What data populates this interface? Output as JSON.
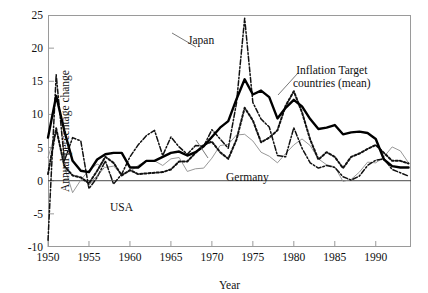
{
  "chart_data": {
    "type": "line",
    "title": "",
    "xlabel": "Year",
    "ylabel": "Annual percentage change",
    "xlim": [
      1950,
      1994.3
    ],
    "ylim": [
      -10,
      25
    ],
    "grid": false,
    "legend_position": "inline-annotations",
    "xticks": [
      1950,
      1955,
      1960,
      1965,
      1970,
      1975,
      1980,
      1985,
      1990
    ],
    "yticks": [
      -10,
      -5,
      0,
      5,
      10,
      15,
      20,
      25
    ],
    "zero_line": 0,
    "annotations": [
      {
        "text": "Japan",
        "series": "Japan"
      },
      {
        "text": "Inflation Target",
        "series": "Inflation Target countries (mean)"
      },
      {
        "text": "countries (mean)",
        "series": "Inflation Target countries (mean)"
      },
      {
        "text": "Germany",
        "series": "Germany"
      },
      {
        "text": "USA",
        "series": "USA"
      }
    ],
    "x": [
      1950,
      1951,
      1952,
      1953,
      1954,
      1955,
      1956,
      1957,
      1958,
      1959,
      1960,
      1961,
      1962,
      1963,
      1964,
      1965,
      1966,
      1967,
      1968,
      1969,
      1970,
      1971,
      1972,
      1973,
      1974,
      1975,
      1976,
      1977,
      1978,
      1979,
      1980,
      1981,
      1982,
      1983,
      1984,
      1985,
      1986,
      1987,
      1988,
      1989,
      1990,
      1991,
      1992,
      1993,
      1994
    ],
    "series": [
      {
        "name": "Inflation Target countries (mean)",
        "style": "thick-solid",
        "color": "#000000",
        "values": [
          6.5,
          12.8,
          7.5,
          3.0,
          1.5,
          1.3,
          3.2,
          4.0,
          4.2,
          4.2,
          2.0,
          2.0,
          3.0,
          3.0,
          3.6,
          4.2,
          4.4,
          3.8,
          4.3,
          5.2,
          6.6,
          8.0,
          9.0,
          12.3,
          15.3,
          13.0,
          13.6,
          12.6,
          9.4,
          11.0,
          12.2,
          11.2,
          9.3,
          7.8,
          8.0,
          8.4,
          7.0,
          7.3,
          7.4,
          7.2,
          6.3,
          3.2,
          2.2,
          2.0,
          2.0
        ]
      },
      {
        "name": "Japan",
        "style": "dash-dot",
        "color": "#111111",
        "values": [
          -9.0,
          16.0,
          3.0,
          6.5,
          6.0,
          -1.2,
          0.5,
          3.0,
          -0.5,
          1.0,
          3.6,
          5.4,
          6.8,
          7.6,
          3.8,
          6.6,
          5.1,
          4.0,
          5.3,
          5.2,
          7.7,
          6.3,
          4.9,
          11.7,
          24.5,
          11.8,
          9.3,
          8.1,
          3.8,
          3.6,
          8.0,
          4.9,
          2.7,
          1.9,
          2.3,
          2.0,
          0.6,
          0.1,
          0.7,
          2.3,
          3.1,
          3.3,
          1.7,
          1.2,
          0.7
        ]
      },
      {
        "name": "USA",
        "style": "thick-dotted",
        "color": "#111111",
        "values": [
          1.0,
          7.9,
          2.2,
          0.8,
          0.5,
          -0.4,
          1.5,
          3.6,
          2.7,
          0.8,
          1.6,
          1.0,
          1.1,
          1.2,
          1.3,
          1.7,
          2.9,
          2.9,
          4.2,
          5.4,
          5.9,
          4.3,
          3.3,
          6.2,
          11.0,
          9.1,
          5.8,
          6.5,
          7.6,
          11.3,
          13.5,
          10.3,
          6.2,
          3.2,
          4.3,
          3.6,
          1.9,
          3.6,
          4.1,
          4.8,
          5.4,
          4.2,
          3.0,
          3.0,
          2.6
        ]
      },
      {
        "name": "Germany",
        "style": "thin-solid",
        "color": "#8c8c8c",
        "values": [
          3.5,
          7.6,
          2.1,
          -1.8,
          0.1,
          1.6,
          2.5,
          2.0,
          2.2,
          1.0,
          1.4,
          2.3,
          3.0,
          3.0,
          2.3,
          3.3,
          3.5,
          1.4,
          1.8,
          1.9,
          3.4,
          5.3,
          5.5,
          6.9,
          7.0,
          6.0,
          4.3,
          3.7,
          2.7,
          4.1,
          5.4,
          6.3,
          5.3,
          3.3,
          2.4,
          2.1,
          -0.1,
          0.2,
          1.3,
          2.8,
          2.7,
          3.6,
          5.1,
          4.5,
          2.7
        ]
      }
    ]
  }
}
